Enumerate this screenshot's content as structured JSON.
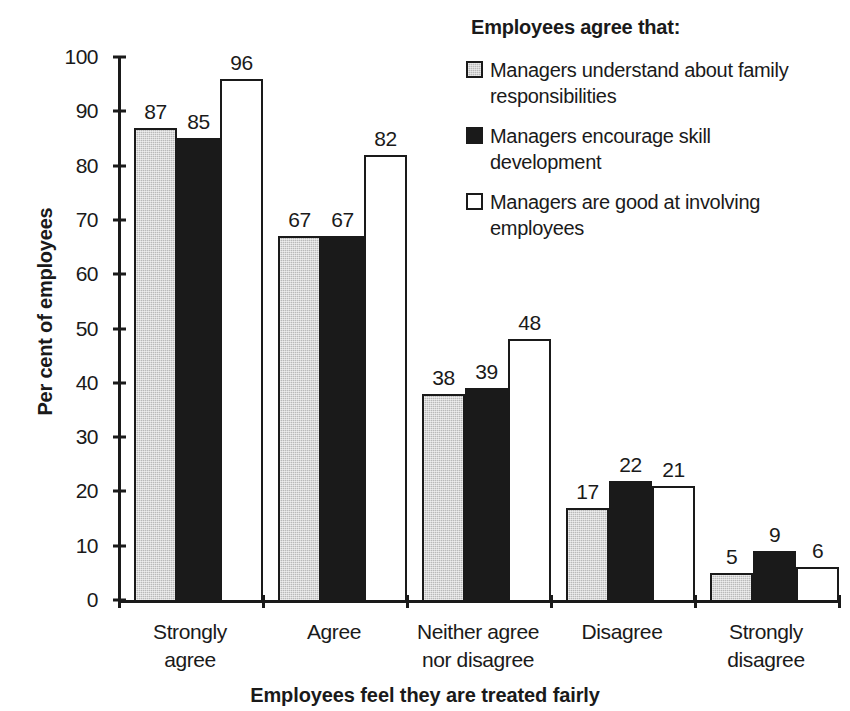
{
  "chart_data": {
    "type": "bar",
    "title": "",
    "xlabel": "Employees feel they are treated fairly",
    "ylabel": "Per cent of employees",
    "ylim": [
      0,
      100
    ],
    "yticks": [
      0,
      10,
      20,
      30,
      40,
      50,
      60,
      70,
      80,
      90,
      100
    ],
    "grid": false,
    "legend_position": "top-right",
    "legend_title": "Employees agree that:",
    "categories": [
      "Strongly\nagree",
      "Agree",
      "Neither agree\nnor disagree",
      "Disagree",
      "Strongly\ndisagree"
    ],
    "category_lines": [
      [
        "Strongly",
        "agree"
      ],
      [
        "Agree",
        ""
      ],
      [
        "Neither agree",
        "nor disagree"
      ],
      [
        "Disagree",
        ""
      ],
      [
        "Strongly",
        "disagree"
      ]
    ],
    "series": [
      {
        "name": "Managers understand about family responsibilities",
        "name_lines": [
          "Managers understand about family",
          "responsibilities"
        ],
        "style": "gray",
        "color": "#b9b9b9",
        "values": [
          87,
          67,
          38,
          17,
          5
        ]
      },
      {
        "name": "Managers encourage skill development",
        "name_lines": [
          "Managers encourage skill",
          "development"
        ],
        "style": "black",
        "color": "#1a1a1a",
        "values": [
          85,
          67,
          39,
          22,
          9
        ]
      },
      {
        "name": "Managers are good at involving employees",
        "name_lines": [
          "Managers are good at involving",
          "employees"
        ],
        "style": "white",
        "color": "#ffffff",
        "values": [
          96,
          82,
          48,
          21,
          6
        ]
      }
    ]
  },
  "axis": {
    "y_title": "Per cent of employees",
    "x_title": "Employees feel they are treated fairly",
    "y_tick_labels": [
      "100",
      "90",
      "80",
      "70",
      "60",
      "50",
      "40",
      "30",
      "20",
      "10",
      "0"
    ]
  },
  "legend": {
    "title": "Employees agree that:",
    "items": [
      {
        "swatch": "gray",
        "line1": "Managers understand about family",
        "line2": "responsibilities"
      },
      {
        "swatch": "black",
        "line1": "Managers encourage skill",
        "line2": "development"
      },
      {
        "swatch": "white",
        "line1": "Managers are good at involving",
        "line2": "employees"
      }
    ]
  },
  "colors": {
    "ink": "#1a1a1a",
    "gray_fill": "#b9b9b9",
    "white_fill": "#ffffff",
    "background": "#ffffff"
  }
}
